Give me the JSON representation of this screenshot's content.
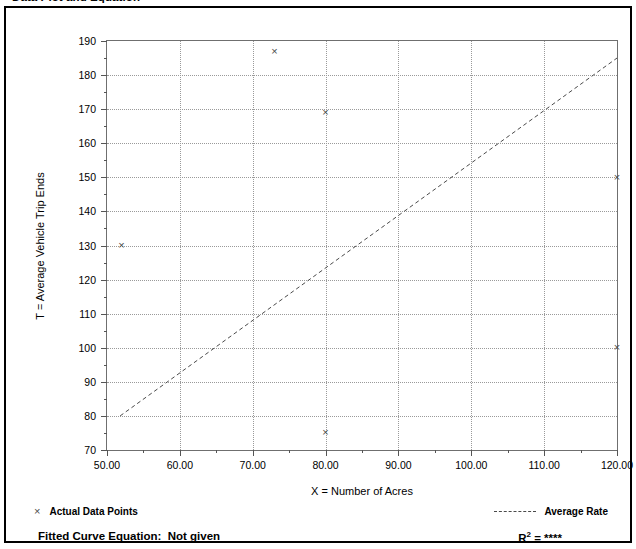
{
  "page": {
    "title": "Data Plot and Equation"
  },
  "chart_data": {
    "type": "scatter",
    "title": "Data Plot and Equation",
    "xlabel": "X = Number of Acres",
    "ylabel": "T = Average Vehicle Trip Ends",
    "xlim": [
      50.0,
      120.0
    ],
    "ylim": [
      70,
      190
    ],
    "xticks": [
      "50.00",
      "60.00",
      "70.00",
      "80.00",
      "90.00",
      "100.00",
      "110.00",
      "120.00"
    ],
    "xtick_values": [
      50,
      60,
      70,
      80,
      90,
      100,
      110,
      120
    ],
    "yticks": [
      "70",
      "80",
      "90",
      "100",
      "110",
      "120",
      "130",
      "140",
      "150",
      "160",
      "170",
      "180",
      "190"
    ],
    "ytick_values": [
      70,
      80,
      90,
      100,
      110,
      120,
      130,
      140,
      150,
      160,
      170,
      180,
      190
    ],
    "grid": true,
    "x_minor_per_major": 2,
    "y_minor_per_major": 2,
    "marker": "x",
    "marker_color": "#4a4a4a",
    "series": [
      {
        "name": "Actual Data Points",
        "points": [
          {
            "x": 52.0,
            "y": 130
          },
          {
            "x": 73.0,
            "y": 187
          },
          {
            "x": 80.0,
            "y": 169
          },
          {
            "x": 80.0,
            "y": 75
          },
          {
            "x": 120.0,
            "y": 150
          },
          {
            "x": 120.0,
            "y": 100
          }
        ]
      }
    ],
    "trendline": {
      "name": "Average Rate",
      "style": "dashed",
      "color": "#4a4a4a",
      "x_start": 51.8,
      "y_start": 80,
      "x_end": 120.0,
      "y_end": 185
    },
    "legend": {
      "position": "below-axes",
      "entries": [
        {
          "label": "Actual Data Points",
          "marker": "x"
        },
        {
          "label": "Average Rate",
          "marker": "dashed-line"
        }
      ]
    },
    "annotations": {
      "fitted_curve_equation_label": "Fitted Curve Equation:",
      "fitted_curve_equation_value": "Not given",
      "r_squared_label": "R",
      "r_squared_exponent": "2",
      "r_squared_value": "= ****"
    }
  },
  "legend": {
    "actual_data_points": "Actual Data Points",
    "average_rate": "Average Rate",
    "marker_glyph": "×"
  },
  "footer": {
    "fitted_equation": "Fitted Curve Equation:  Not given",
    "r_label": "R",
    "r_exp": "2",
    "r_value": "= ****"
  }
}
